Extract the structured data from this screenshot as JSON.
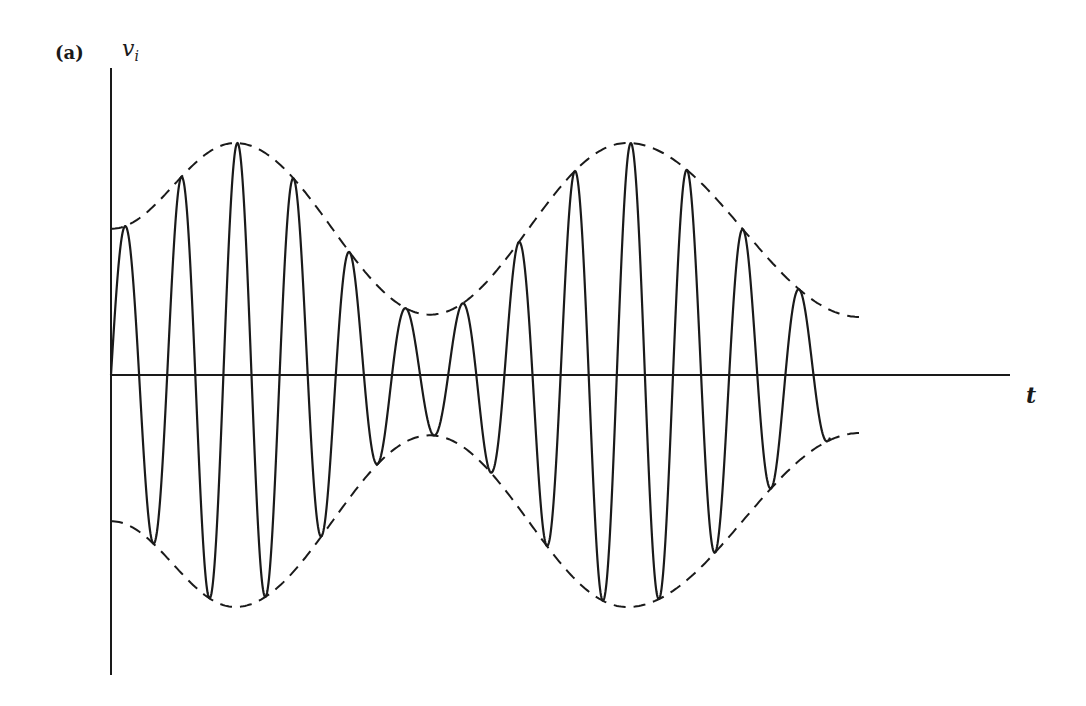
{
  "figure": {
    "panel_label": "(a)",
    "y_axis_label": "v",
    "y_axis_subscript": "i",
    "x_axis_label": "t",
    "caption_type": "amplitude-modulated waveform with dashed envelope",
    "colors": {
      "line": "#1a1a1a",
      "background": "#ffffff"
    }
  },
  "chart_data": {
    "type": "line",
    "title": "",
    "xlabel": "t",
    "ylabel": "v_i",
    "grid": false,
    "legend": false,
    "series": [
      {
        "name": "carrier (solid)",
        "style": "solid",
        "description": "AM carrier oscillation, ~13 cycles, amplitude follows envelope",
        "peaks_x": [
          123,
          180,
          235,
          291,
          346,
          401,
          458,
          514,
          571,
          627,
          683,
          739,
          795
        ],
        "troughs_x": [
          151,
          208,
          263,
          318,
          374,
          430,
          486,
          543,
          599,
          655,
          711,
          767,
          824
        ]
      },
      {
        "name": "upper envelope (dashed)",
        "style": "dashed",
        "relative_amplitude": [
          0.63,
          1.0,
          0.26,
          1.0,
          0.25
        ],
        "at_x": [
          111,
          235,
          430,
          627,
          860
        ]
      },
      {
        "name": "lower envelope (dashed)",
        "style": "dashed",
        "relative_amplitude": [
          -0.63,
          -1.0,
          -0.26,
          -1.0,
          -0.25
        ],
        "at_x": [
          111,
          235,
          430,
          627,
          860
        ]
      }
    ]
  }
}
